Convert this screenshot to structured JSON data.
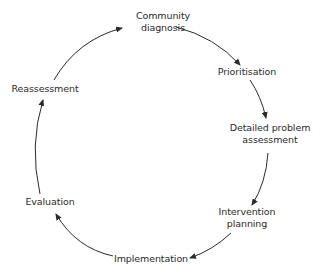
{
  "diagram": {
    "type": "cycle",
    "nodes": [
      {
        "id": "community-diagnosis",
        "line1": "Community",
        "line2": "diagnosis"
      },
      {
        "id": "prioritisation",
        "line1": "Prioritisation"
      },
      {
        "id": "detailed-problem-assessment",
        "line1": "Detailed problem",
        "line2": "assessment"
      },
      {
        "id": "intervention-planning",
        "line1": "Intervention",
        "line2": "planning"
      },
      {
        "id": "implementation",
        "line1": "Implementation"
      },
      {
        "id": "evaluation",
        "line1": "Evaluation"
      },
      {
        "id": "reassessment",
        "line1": "Reassessment"
      }
    ],
    "edges": [
      {
        "from": "community-diagnosis",
        "to": "prioritisation"
      },
      {
        "from": "prioritisation",
        "to": "detailed-problem-assessment"
      },
      {
        "from": "detailed-problem-assessment",
        "to": "intervention-planning"
      },
      {
        "from": "intervention-planning",
        "to": "implementation"
      },
      {
        "from": "implementation",
        "to": "evaluation"
      },
      {
        "from": "evaluation",
        "to": "reassessment"
      },
      {
        "from": "reassessment",
        "to": "community-diagnosis"
      }
    ],
    "colors": {
      "text": "#2a2a2a",
      "arrow": "#2a2a2a",
      "background": "#ffffff"
    }
  }
}
